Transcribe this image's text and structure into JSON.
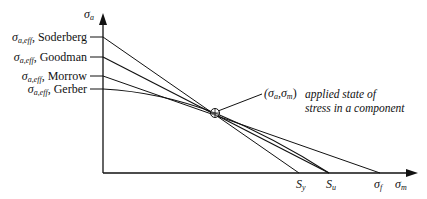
{
  "diagram": {
    "axes": {
      "y_axis_symbol": "σ",
      "y_axis_sub": "a",
      "x_axis_symbol": "σ",
      "x_axis_sub": "m"
    },
    "criteria": [
      {
        "symbol": "σ",
        "sub": "a,eff",
        "name": "Soderberg",
        "intercept_label": "S",
        "intercept_sub": "y"
      },
      {
        "symbol": "σ",
        "sub": "a,eff",
        "name": "Goodman",
        "intercept_label": "S",
        "intercept_sub": "u"
      },
      {
        "symbol": "σ",
        "sub": "a,eff",
        "name": "Morrow",
        "intercept_label": "σ",
        "intercept_sub": "f"
      },
      {
        "symbol": "σ",
        "sub": "a,eff",
        "name": "Gerber",
        "intercept_label": "",
        "intercept_sub": ""
      }
    ],
    "x_intercepts": [
      {
        "symbol": "S",
        "sub": "y"
      },
      {
        "symbol": "S",
        "sub": "u"
      },
      {
        "symbol": "σ",
        "sub": "f"
      }
    ],
    "point": {
      "label_open": "(σ",
      "sub1": "a",
      "comma": ",σ",
      "sub2": "m",
      "label_close": ")",
      "annotation_line1": "applied state of",
      "annotation_line2": "stress in a component"
    },
    "colors": {
      "line": "#111111",
      "background": "#ffffff"
    }
  }
}
